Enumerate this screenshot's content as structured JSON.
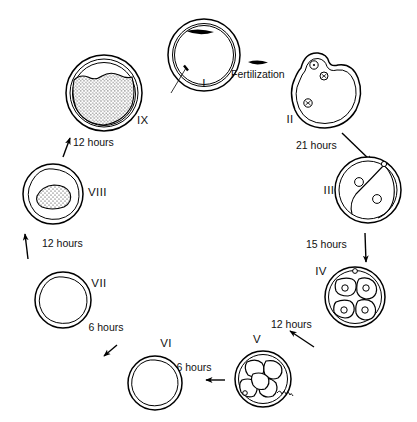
{
  "figure": {
    "background_color": "#ffffff",
    "ink_color": "#000000"
  },
  "stages": [
    {
      "id": "I",
      "label": "I",
      "description": "unfertilized-ovum-with-zona-pellucida",
      "cx": 204,
      "cy": 55,
      "r": 36,
      "label_x": 204,
      "label_y": 87
    },
    {
      "id": "II",
      "label": "II",
      "description": "fertilized-ovum-pronuclei-polar-bodies",
      "cx": 322,
      "cy": 90,
      "r": 37,
      "label_x": 290,
      "label_y": 123
    },
    {
      "id": "III",
      "label": "III",
      "description": "two-cell-stage",
      "cx": 368,
      "cy": 190,
      "r": 33,
      "label_x": 329,
      "label_y": 194
    },
    {
      "id": "IV",
      "label": "IV",
      "description": "four-cell-stage",
      "cx": 355,
      "cy": 297,
      "r": 30,
      "label_x": 321,
      "label_y": 275
    },
    {
      "id": "V",
      "label": "V",
      "description": "morula-stage",
      "cx": 263,
      "cy": 379,
      "r": 28,
      "label_x": 257,
      "label_y": 343
    },
    {
      "id": "VI",
      "label": "VI",
      "description": "early-blastocyst",
      "cx": 155,
      "cy": 383,
      "r": 27,
      "label_x": 166,
      "label_y": 347
    },
    {
      "id": "VII",
      "label": "VII",
      "description": "blastocyst",
      "cx": 63,
      "cy": 300,
      "r": 28,
      "label_x": 99,
      "label_y": 287
    },
    {
      "id": "VIII",
      "label": "VIII",
      "description": "blastocyst-with-inner-cell-mass",
      "cx": 53,
      "cy": 194,
      "r": 30,
      "label_x": 88,
      "label_y": 196
    },
    {
      "id": "IX",
      "label": "IX",
      "description": "expanded-blastocyst-zona-loss",
      "cx": 104,
      "cy": 93,
      "r": 38,
      "label_x": 137,
      "label_y": 124
    }
  ],
  "events": [
    {
      "name": "fertilization",
      "label": "Fertilization",
      "x": 231,
      "y": 78
    }
  ],
  "intervals": [
    {
      "from": "II",
      "to": "III",
      "label": "21 hours",
      "x": 296,
      "y": 149
    },
    {
      "from": "III",
      "to": "IV",
      "label": "15 hours",
      "x": 306,
      "y": 248
    },
    {
      "from": "IV",
      "to": "V",
      "label": "12 hours",
      "x": 271,
      "y": 328
    },
    {
      "from": "V",
      "to": "VI",
      "label": "6 hours",
      "x": 194,
      "y": 371
    },
    {
      "from": "VI",
      "to": "VII",
      "label": "6 hours",
      "x": 106,
      "y": 331
    },
    {
      "from": "VII",
      "to": "VIII",
      "label": "12 hours",
      "x": 42,
      "y": 247
    },
    {
      "from": "VIII",
      "to": "IX",
      "label": "12 hours",
      "x": 73,
      "y": 146
    }
  ]
}
